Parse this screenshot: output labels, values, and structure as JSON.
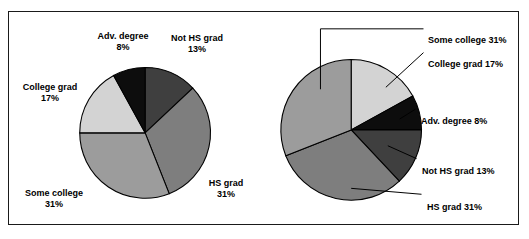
{
  "figure": {
    "background": "#ffffff",
    "border_color": "#1a1a1a"
  },
  "chart_data": [
    {
      "id": "left-pie",
      "type": "pie",
      "title": "",
      "label_style": "outside-two-line",
      "start_angle_deg": 0,
      "direction": "clockwise",
      "center": {
        "x": 145,
        "y": 134
      },
      "radius": 66,
      "categories": [
        "Not HS grad",
        "HS grad",
        "Some college",
        "College grad",
        "Adv. degree"
      ],
      "values": [
        13,
        31,
        31,
        17,
        8
      ],
      "unit": "%",
      "colors": [
        "#3f3f3f",
        "#7e7e7e",
        "#9c9c9c",
        "#d3d3d3",
        "#0d0d0d"
      ],
      "slice_outline": "#000000",
      "slices": [
        {
          "name": "Not HS grad",
          "value": 13,
          "label": "Not HS grad",
          "percent": "13%",
          "color": "#3f3f3f"
        },
        {
          "name": "HS grad",
          "value": 31,
          "label": "HS grad",
          "percent": "31%",
          "color": "#7e7e7e"
        },
        {
          "name": "Some college",
          "value": 31,
          "label": "Some college",
          "percent": "31%",
          "color": "#9c9c9c"
        },
        {
          "name": "College grad",
          "value": 17,
          "label": "College grad",
          "percent": "17%",
          "color": "#d3d3d3"
        },
        {
          "name": "Adv. degree",
          "value": 8,
          "label": "Adv. degree",
          "percent": "8%",
          "color": "#0d0d0d"
        }
      ]
    },
    {
      "id": "right-pie",
      "type": "pie",
      "title": "",
      "label_style": "leader-line-right",
      "start_angle_deg": 0,
      "direction": "clockwise",
      "center": {
        "x": 353,
        "y": 131
      },
      "radius": 71,
      "categories": [
        "College grad",
        "Adv. degree",
        "Not HS grad",
        "HS grad",
        "Some college"
      ],
      "values": [
        17,
        8,
        13,
        31,
        31
      ],
      "unit": "%",
      "colors": [
        "#d3d3d3",
        "#0d0d0d",
        "#3f3f3f",
        "#7e7e7e",
        "#9c9c9c"
      ],
      "slice_outline": "#000000",
      "slices": [
        {
          "name": "College grad",
          "value": 17,
          "label": "College grad 17%",
          "color": "#d3d3d3"
        },
        {
          "name": "Adv. degree",
          "value": 8,
          "label": "Adv. degree 8%",
          "color": "#0d0d0d"
        },
        {
          "name": "Not HS grad",
          "value": 13,
          "label": "Not HS grad 13%",
          "color": "#3f3f3f"
        },
        {
          "name": "HS grad",
          "value": 31,
          "label": "HS grad 31%",
          "color": "#7e7e7e"
        },
        {
          "name": "Some college",
          "value": 31,
          "label": "Some college 31%",
          "color": "#9c9c9c"
        }
      ]
    }
  ],
  "left_labels": {
    "adv_degree_name": "Adv. degree",
    "adv_degree_pct": "8%",
    "not_hs_grad_name": "Not HS grad",
    "not_hs_grad_pct": "13%",
    "college_grad_name": "College grad",
    "college_grad_pct": "17%",
    "some_college_name": "Some college",
    "some_college_pct": "31%",
    "hs_grad_name": "HS grad",
    "hs_grad_pct": "31%"
  },
  "right_labels": {
    "some_college": "Some college 31%",
    "college_grad": "College grad 17%",
    "adv_degree": "Adv. degree 8%",
    "not_hs_grad": "Not HS grad 13%",
    "hs_grad": "HS grad 31%"
  }
}
